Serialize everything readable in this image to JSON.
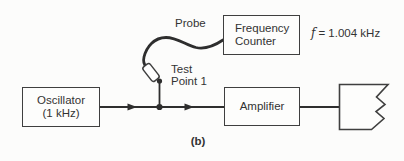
{
  "blocks": {
    "oscillator": {
      "line1": "Oscillator",
      "line2": "(1 kHz)"
    },
    "frequency_counter": {
      "line1": "Frequency",
      "line2": "Counter"
    },
    "amplifier": {
      "label": "Amplifier"
    }
  },
  "labels": {
    "probe": "Probe",
    "test_point": {
      "line1": "Test",
      "line2": "Point 1"
    },
    "frequency_reading": {
      "symbol": "f",
      "value": "= 1.004 kHz"
    },
    "caption": "(b)"
  },
  "icons": {
    "probe_connector": "probe-connector-icon",
    "load": "torn-edge-load-icon"
  },
  "colors": {
    "wire": "#2e2e2e",
    "box_border": "#3f3f3f",
    "text": "#333333",
    "background": "#fcfcfb",
    "connector_fill": "#ffffff"
  }
}
